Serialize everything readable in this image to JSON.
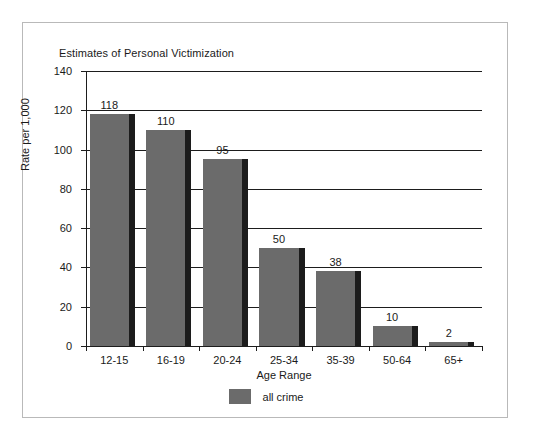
{
  "chart_data": {
    "type": "bar",
    "title": "Estimates of Personal Victimization",
    "xlabel": "Age Range",
    "ylabel": "Rate per 1,000",
    "categories": [
      "12-15",
      "16-19",
      "20-24",
      "25-34",
      "35-39",
      "50-64",
      "65+"
    ],
    "values": [
      118,
      110,
      95,
      50,
      38,
      10,
      2
    ],
    "series": [
      {
        "name": "all crime",
        "values": [
          118,
          110,
          95,
          50,
          38,
          10,
          2
        ],
        "color": "#6b6b6b"
      }
    ],
    "ylim": [
      0,
      140
    ],
    "y_ticks": [
      0,
      20,
      40,
      60,
      80,
      100,
      120,
      140
    ],
    "grid": true,
    "legend_position": "bottom",
    "value_labels_shown": true,
    "bar_shadow_color": "#1c1c1c"
  },
  "legend": {
    "items": [
      {
        "label": "all crime",
        "color": "#6b6b6b"
      }
    ]
  },
  "colors": {
    "bar": "#6b6b6b",
    "shadow": "#1c1c1c",
    "axis": "#1d1d1d",
    "frame": "#b9b9b9",
    "text": "#1a1a1a",
    "background": "#ffffff"
  }
}
